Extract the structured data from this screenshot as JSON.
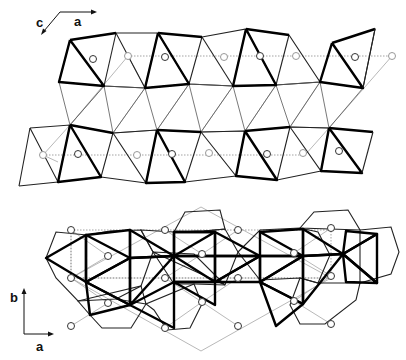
{
  "figure": {
    "panels": [
      {
        "id": "top-projection",
        "axes": {
          "horizontal_label": "a",
          "diagonal_label": "c"
        },
        "description": "Layer of corner-sharing polyhedra viewed along b; two rows of bold-edged octahedra with open circle cations"
      },
      {
        "id": "bottom-projection",
        "axes": {
          "horizontal_label": "a",
          "vertical_label": "b"
        },
        "description": "Projection along c showing edge-sharing octahedra clusters, hexagonal outlines, rhombic unit cell and open circle cations"
      }
    ]
  }
}
